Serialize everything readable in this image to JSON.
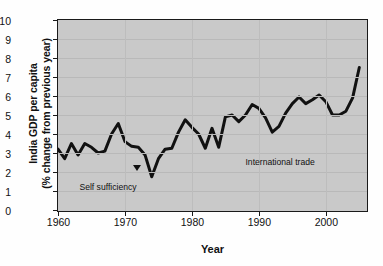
{
  "chart_data": {
    "type": "line",
    "title": "",
    "xlabel": "Year",
    "ylabel": "India GDP per capita (% change from previous year)",
    "ylabel_line1": "India GDP per capita",
    "ylabel_line2": "(% change from previous year)",
    "xlim": [
      1960,
      2006
    ],
    "ylim": [
      0,
      10
    ],
    "ytick_values": [
      0,
      1,
      2,
      3,
      4,
      5,
      6,
      7,
      8,
      9,
      10
    ],
    "ytick_labels": [
      "0",
      "1",
      "2",
      "3",
      "4",
      "5",
      "6",
      "7",
      "8",
      "9",
      "10"
    ],
    "xtick_values": [
      1960,
      1970,
      1980,
      1990,
      2000
    ],
    "xtick_labels": [
      "1960",
      "1970",
      "1980",
      "1990",
      "2000"
    ],
    "grid": true,
    "legend": "none",
    "line_color": "#111111",
    "plot_background": "#c9c9c9",
    "series": [
      {
        "name": "India GDP per capita (% change from previous year)",
        "x": [
          1960,
          1961,
          1962,
          1963,
          1964,
          1965,
          1966,
          1967,
          1968,
          1969,
          1970,
          1971,
          1972,
          1973,
          1974,
          1975,
          1976,
          1977,
          1978,
          1979,
          1980,
          1981,
          1982,
          1983,
          1984,
          1985,
          1986,
          1987,
          1988,
          1989,
          1990,
          1991,
          1992,
          1993,
          1994,
          1995,
          1996,
          1997,
          1998,
          1999,
          2000,
          2001,
          2002,
          2003,
          2004,
          2005
        ],
        "values": [
          3.2,
          2.7,
          3.5,
          2.9,
          3.5,
          3.3,
          3.0,
          3.1,
          4.0,
          4.55,
          3.6,
          3.35,
          3.3,
          2.9,
          1.75,
          2.7,
          3.2,
          3.25,
          4.1,
          4.75,
          4.35,
          4.0,
          3.25,
          4.3,
          3.3,
          4.9,
          5.0,
          4.65,
          5.0,
          5.55,
          5.35,
          4.85,
          4.1,
          4.4,
          5.1,
          5.6,
          5.95,
          5.6,
          5.8,
          6.05,
          5.7,
          5.0,
          5.0,
          5.2,
          5.9,
          7.5
        ]
      }
    ],
    "annotations": [
      {
        "text": "Self sufficiency",
        "x": 1963.2,
        "y": 1.15
      },
      {
        "text": "International trade",
        "x": 1988.0,
        "y": 2.5
      }
    ]
  },
  "axis": {
    "y_title": "India GDP per capita (% change from previous year)",
    "x_title": "Year"
  }
}
